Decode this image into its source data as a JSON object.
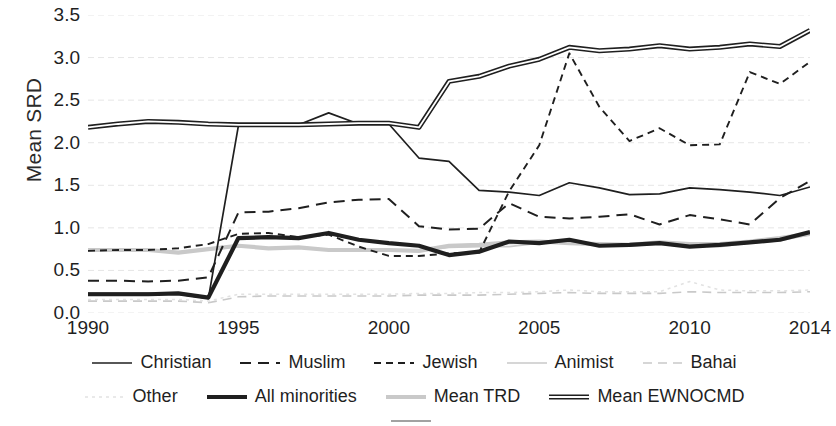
{
  "axes": {
    "ylabel": "Mean SRD",
    "xlabel": "",
    "yticks": [
      "0.0",
      "0.5",
      "1.0",
      "1.5",
      "2.0",
      "2.5",
      "3.0",
      "3.5"
    ],
    "xticks": [
      "1990",
      "1995",
      "2000",
      "2005",
      "2010",
      "2014"
    ]
  },
  "legend": {
    "rows": [
      [
        {
          "label": "Christian",
          "style": "solid-thin-dark"
        },
        {
          "label": "Muslim",
          "style": "dash-long-dark"
        },
        {
          "label": "Jewish",
          "style": "dash-short-dark"
        },
        {
          "label": "Animist",
          "style": "solid-thin-light"
        },
        {
          "label": "Bahai",
          "style": "dash-long-light"
        }
      ],
      [
        {
          "label": "Other",
          "style": "dot-light"
        },
        {
          "label": "All minorities",
          "style": "solid-thick-dark"
        },
        {
          "label": "Mean TRD",
          "style": "solid-thick-light"
        },
        {
          "label": "Mean EWNOCMD",
          "style": "solid-thick-hollow"
        }
      ],
      [
        {
          "label": "",
          "style": "clipped"
        }
      ]
    ]
  },
  "colors": {
    "dark": "#1f1f1f",
    "mid": "#595959",
    "light": "#c9c9c9",
    "verylight": "#e2e2e2",
    "grid": "#e6e6e6",
    "background": "#ffffff"
  },
  "chart_data": {
    "type": "line",
    "title": "",
    "xlabel": "",
    "ylabel": "Mean SRD",
    "xlim": [
      1990,
      2014
    ],
    "ylim": [
      0.0,
      3.5
    ],
    "grid": true,
    "legend_position": "bottom",
    "x": [
      1990,
      1991,
      1992,
      1993,
      1994,
      1995,
      1996,
      1997,
      1998,
      1999,
      2000,
      2001,
      2002,
      2003,
      2004,
      2005,
      2006,
      2007,
      2008,
      2009,
      2010,
      2011,
      2012,
      2013,
      2014
    ],
    "series": [
      {
        "name": "Christian",
        "style": "solid-thin-dark",
        "values": [
          0.23,
          0.23,
          0.23,
          0.22,
          0.17,
          2.2,
          2.2,
          2.21,
          2.35,
          2.22,
          2.22,
          1.82,
          1.78,
          1.44,
          1.42,
          1.38,
          1.53,
          1.47,
          1.39,
          1.4,
          1.47,
          1.45,
          1.42,
          1.38,
          1.48
        ]
      },
      {
        "name": "Muslim",
        "style": "dash-long-dark",
        "values": [
          0.38,
          0.38,
          0.37,
          0.38,
          0.42,
          1.18,
          1.19,
          1.23,
          1.3,
          1.33,
          1.34,
          1.02,
          0.98,
          0.99,
          1.29,
          1.13,
          1.11,
          1.13,
          1.16,
          1.04,
          1.15,
          1.1,
          1.04,
          1.35,
          1.55
        ]
      },
      {
        "name": "Jewish",
        "style": "dash-short-dark",
        "values": [
          0.73,
          0.74,
          0.74,
          0.76,
          0.81,
          0.93,
          0.94,
          0.89,
          0.92,
          0.78,
          0.67,
          0.67,
          0.7,
          0.71,
          1.43,
          1.97,
          3.05,
          2.42,
          2.02,
          2.17,
          1.97,
          1.98,
          2.83,
          2.69,
          2.95
        ]
      },
      {
        "name": "Animist",
        "style": "solid-thin-light",
        "values": [
          0.74,
          0.74,
          0.74,
          0.71,
          0.75,
          0.79,
          0.76,
          0.77,
          0.74,
          0.74,
          0.74,
          0.73,
          0.77,
          0.78,
          0.78,
          0.82,
          0.83,
          0.81,
          0.8,
          0.81,
          0.79,
          0.78,
          0.82,
          0.85,
          0.92
        ]
      },
      {
        "name": "Bahai",
        "style": "dash-long-light",
        "values": [
          0.14,
          0.14,
          0.14,
          0.14,
          0.12,
          0.19,
          0.2,
          0.2,
          0.2,
          0.2,
          0.2,
          0.21,
          0.21,
          0.21,
          0.22,
          0.23,
          0.24,
          0.23,
          0.23,
          0.23,
          0.25,
          0.24,
          0.24,
          0.24,
          0.25
        ]
      },
      {
        "name": "Other",
        "style": "dot-light",
        "values": [
          0.16,
          0.16,
          0.16,
          0.16,
          0.14,
          0.22,
          0.22,
          0.22,
          0.22,
          0.22,
          0.22,
          0.23,
          0.23,
          0.24,
          0.24,
          0.25,
          0.27,
          0.25,
          0.25,
          0.25,
          0.37,
          0.27,
          0.26,
          0.26,
          0.27
        ]
      },
      {
        "name": "All minorities",
        "style": "solid-thick-dark",
        "values": [
          0.22,
          0.22,
          0.22,
          0.23,
          0.18,
          0.88,
          0.89,
          0.88,
          0.94,
          0.86,
          0.82,
          0.79,
          0.68,
          0.72,
          0.84,
          0.82,
          0.86,
          0.79,
          0.8,
          0.82,
          0.78,
          0.8,
          0.83,
          0.86,
          0.95
        ]
      },
      {
        "name": "Mean TRD",
        "style": "solid-thick-light",
        "values": [
          0.74,
          0.74,
          0.74,
          0.71,
          0.75,
          0.79,
          0.76,
          0.77,
          0.74,
          0.74,
          0.74,
          0.73,
          0.79,
          0.8,
          0.83,
          0.84,
          0.82,
          0.81,
          0.8,
          0.83,
          0.81,
          0.81,
          0.84,
          0.88,
          0.93
        ]
      },
      {
        "name": "Mean EWNOCMD",
        "style": "solid-thick-hollow",
        "values": [
          2.18,
          2.22,
          2.25,
          2.24,
          2.22,
          2.21,
          2.21,
          2.21,
          2.22,
          2.23,
          2.23,
          2.18,
          2.72,
          2.78,
          2.9,
          2.98,
          3.12,
          3.08,
          3.1,
          3.14,
          3.1,
          3.12,
          3.16,
          3.13,
          3.32
        ]
      }
    ]
  }
}
